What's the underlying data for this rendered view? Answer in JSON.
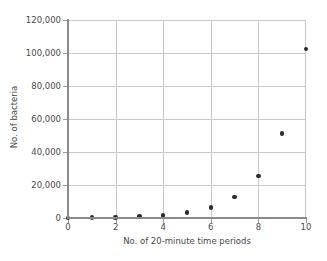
{
  "chart_data": {
    "type": "scatter",
    "title": "",
    "xlabel": "No. of 20-minute time periods",
    "ylabel": "No. of bacteria",
    "xlim": [
      0,
      10
    ],
    "ylim": [
      0,
      120000
    ],
    "grid": true,
    "legend": "none",
    "marker": {
      "shape": "circle",
      "color": "#2b2b2b",
      "size_px": 4.5
    },
    "x": [
      0,
      1,
      2,
      3,
      4,
      5,
      6,
      7,
      8,
      9,
      10
    ],
    "values": [
      100,
      200,
      400,
      800,
      1600,
      3200,
      6400,
      12800,
      25600,
      51200,
      102400
    ],
    "series": [
      {
        "name": "No. of bacteria",
        "values": [
          100,
          200,
          400,
          800,
          1600,
          3200,
          6400,
          12800,
          25600,
          51200,
          102400
        ]
      }
    ],
    "xticks": [
      0,
      2,
      4,
      6,
      8,
      10
    ],
    "xtick_labels": [
      "0",
      "2",
      "4",
      "6",
      "8",
      "10"
    ],
    "yticks": [
      0,
      20000,
      40000,
      60000,
      80000,
      100000,
      120000
    ],
    "ytick_labels": [
      "0",
      "20,000",
      "40,000",
      "60,000",
      "80,000",
      "100,000",
      "120,000"
    ],
    "colors": {
      "background": "#ffffff",
      "gridline": "#c9c9c9",
      "axis": "#8a8a8a",
      "text": "#4a4a4a",
      "marker": "#2b2b2b"
    }
  }
}
